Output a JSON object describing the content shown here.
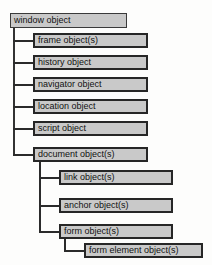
{
  "diagram": {
    "type": "tree",
    "box_fill_color": "#c9c9c9",
    "box_border_color": "#262626",
    "connector_color": "#2b2b2b",
    "background_color": "#fdfdfc",
    "nodes": [
      {
        "id": "window",
        "label": "window object",
        "level": 1,
        "parent": null
      },
      {
        "id": "frame",
        "label": "frame object(s)",
        "level": 2,
        "parent": "window"
      },
      {
        "id": "history",
        "label": "history object",
        "level": 2,
        "parent": "window"
      },
      {
        "id": "navigator",
        "label": "navigator object",
        "level": 2,
        "parent": "window"
      },
      {
        "id": "location",
        "label": "location object",
        "level": 2,
        "parent": "window"
      },
      {
        "id": "script",
        "label": "script object",
        "level": 2,
        "parent": "window"
      },
      {
        "id": "document",
        "label": "document object(s)",
        "level": 2,
        "parent": "window"
      },
      {
        "id": "link",
        "label": "link object(s)",
        "level": 3,
        "parent": "document"
      },
      {
        "id": "anchor",
        "label": "anchor object(s)",
        "level": 3,
        "parent": "document"
      },
      {
        "id": "form",
        "label": "form object(s)",
        "level": 3,
        "parent": "document"
      },
      {
        "id": "formelement",
        "label": "form element object(s)",
        "level": 4,
        "parent": "form"
      }
    ]
  }
}
